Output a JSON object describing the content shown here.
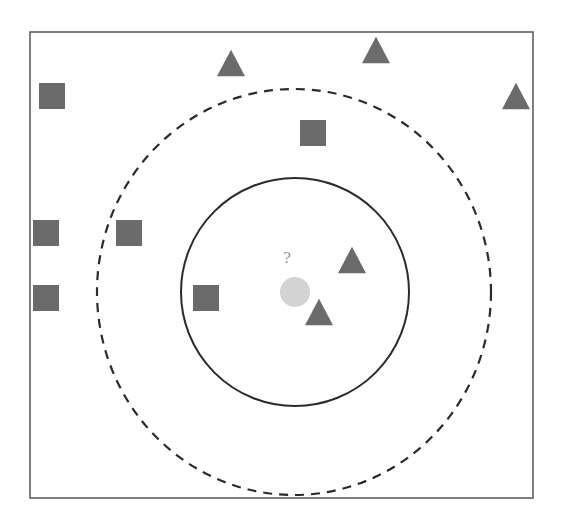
{
  "diagram": {
    "type": "knn-classification-illustration",
    "colors": {
      "frame": "#555555",
      "shape_fill": "#6b6b6b",
      "query_fill": "#d3d3d3",
      "query_label": "#9a9a9a",
      "circle_stroke": "#2b2b2b"
    },
    "frame": {
      "x": 30,
      "y": 32,
      "width": 503,
      "height": 466
    },
    "query_point": {
      "cx": 295,
      "cy": 292,
      "r": 15,
      "label": "?",
      "label_x": 287,
      "label_y": 258
    },
    "inner_circle": {
      "cx": 295,
      "cy": 292,
      "r": 114,
      "style": "solid",
      "k": 3
    },
    "outer_circle": {
      "cx": 294,
      "cy": 292,
      "rx": 197,
      "ry": 203,
      "style": "dashed",
      "k": 5
    },
    "squares": [
      {
        "cx": 52,
        "cy": 96
      },
      {
        "cx": 313,
        "cy": 133
      },
      {
        "cx": 46,
        "cy": 233
      },
      {
        "cx": 129,
        "cy": 233
      },
      {
        "cx": 46,
        "cy": 298
      },
      {
        "cx": 206,
        "cy": 298
      }
    ],
    "triangles": [
      {
        "cx": 231,
        "cy": 63
      },
      {
        "cx": 376,
        "cy": 50
      },
      {
        "cx": 516,
        "cy": 96
      },
      {
        "cx": 352,
        "cy": 260
      },
      {
        "cx": 319,
        "cy": 312
      }
    ],
    "square_size": 26,
    "triangle_size": 28
  }
}
